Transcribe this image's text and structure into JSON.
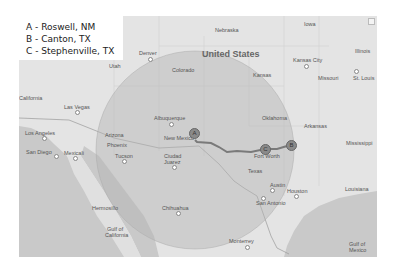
{
  "legend": {
    "items": [
      {
        "letter": "A",
        "text": "A - Roswell, NM"
      },
      {
        "letter": "B",
        "text": "B - Canton, TX"
      },
      {
        "letter": "C",
        "text": "C - Stephenville, TX"
      }
    ]
  },
  "map": {
    "country_label": "United States",
    "state_labels": [
      "Nebraska",
      "Iowa",
      "Illinois",
      "Utah",
      "Colorado",
      "Kansas",
      "Missouri",
      "California",
      "Arizona",
      "New Mexico",
      "Oklahoma",
      "Arkansas",
      "Mississippi",
      "Texas",
      "Louisiana"
    ],
    "city_labels": [
      "Denver",
      "Kansas City",
      "St. Louis",
      "Las Vegas",
      "Albuquerque",
      "Los Angeles",
      "San Diego",
      "Mexicali",
      "Phoenix",
      "Tucson",
      "Ciudad Juarez",
      "Fort Worth",
      "Dallas",
      "Austin",
      "Houston",
      "San Antonio",
      "Hermosillo",
      "Chihuahua",
      "Monterrey"
    ],
    "water_labels": [
      "Gulf of California",
      "Gulf of Mexico"
    ],
    "labels": {
      "nebraska": "Nebraska",
      "iowa": "Iowa",
      "illinois": "Illinois",
      "united_states": "United States",
      "denver": "Denver",
      "utah": "Utah",
      "colorado": "Colorado",
      "kansas": "Kansas",
      "kansas_city": "Kansas City",
      "missouri": "Missouri",
      "st_louis": "St. Louis",
      "california": "California",
      "las_vegas": "Las Vegas",
      "albuquerque": "Albuquerque",
      "oklahoma": "Oklahoma",
      "arkansas": "Arkansas",
      "los_angeles": "Los Angeles",
      "arizona": "Arizona",
      "new_mexico": "New Mexico",
      "mississippi": "Mississippi",
      "san_diego": "San Diego",
      "mexicali": "Mexicali",
      "phoenix": "Phoenix",
      "tucson": "Tucson",
      "ciudad": "Ciudad",
      "juarez": "Juarez",
      "fort_worth": "Fort Worth",
      "texas": "Texas",
      "austin": "Austin",
      "houston": "Houston",
      "louisiana": "Louisiana",
      "san_antonio": "San Antonio",
      "hermosillo": "Hermosillo",
      "chihuahua": "Chihuahua",
      "gulf_of": "Gulf of",
      "california_gulf": "California",
      "monterrey": "Monterrey",
      "gulf_of_2": "Gulf of",
      "mexico": "Mexico"
    },
    "markers": [
      {
        "label": "A",
        "place": "Roswell, NM"
      },
      {
        "label": "B",
        "place": "Canton, TX"
      },
      {
        "label": "C",
        "place": "Stephenville, TX"
      }
    ],
    "colors": {
      "land": "#e4e4e4",
      "water": "#c8c8c8",
      "radius_circle": "#b4b4b4",
      "route": "#7a7a7a",
      "marker": "#8a8a8a"
    }
  }
}
